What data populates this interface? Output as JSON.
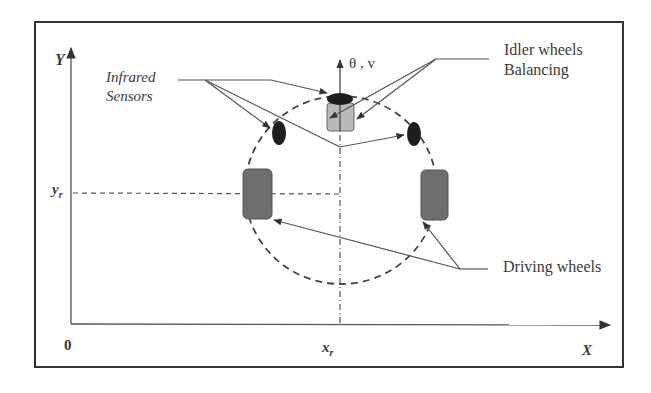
{
  "diagram": {
    "title": "",
    "axes": {
      "y_label": "Y",
      "x_label": "X",
      "origin_label": "0",
      "xr_label": "x",
      "xr_sub": "r",
      "yr_label": "y",
      "yr_sub": "r"
    },
    "heading_label": "θ , v",
    "annotations": {
      "infrared_line1": "Infrared",
      "infrared_line2": "Sensors",
      "idler_line1": "Idler wheels",
      "idler_line2": "Balancing",
      "driving": "Driving wheels"
    },
    "colors": {
      "line": "#4a4a4a",
      "wheel_fill": "#6e6e6e",
      "caster_fill": "#b9b9b9",
      "sensor_fill": "#1e1e1e",
      "frame": "#333333"
    }
  }
}
